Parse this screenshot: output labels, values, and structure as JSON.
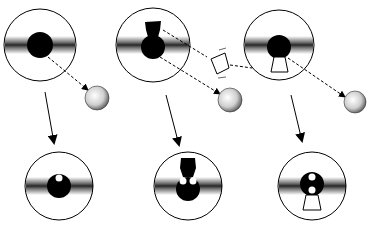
{
  "diagram": {
    "colors": {
      "ink": "#000000",
      "background": "#ffffff",
      "band": "#2a2a2a"
    },
    "columns": [
      {
        "id": "col1",
        "top": {
          "shape": "round-core",
          "cx": 40,
          "cy": 45,
          "r": 36
        },
        "emitted": [
          {
            "type": "sphere",
            "cx": 97,
            "cy": 98,
            "r": 12
          }
        ],
        "bottom": {
          "shape": "round-core-with-1-hole",
          "cx": 59,
          "cy": 186,
          "r": 34
        }
      },
      {
        "id": "col2",
        "top": {
          "shape": "keyhole-core",
          "cx": 153,
          "cy": 45,
          "r": 37
        },
        "emitted": [
          {
            "type": "trapezoid",
            "cx": 219,
            "cy": 65
          },
          {
            "type": "sphere",
            "cx": 230,
            "cy": 100,
            "r": 12
          }
        ],
        "bottom": {
          "shape": "keyhole-core-with-2-holes",
          "cx": 188,
          "cy": 186,
          "r": 34
        }
      },
      {
        "id": "col3",
        "top": {
          "shape": "round-core-with-trapezoid",
          "cx": 279,
          "cy": 45,
          "r": 35
        },
        "emitted": [
          {
            "type": "sphere",
            "cx": 355,
            "cy": 102,
            "r": 11
          }
        ],
        "bottom": {
          "shape": "round-core-with-2-holes-and-trapezoid",
          "cx": 312,
          "cy": 186,
          "r": 34
        }
      }
    ]
  }
}
